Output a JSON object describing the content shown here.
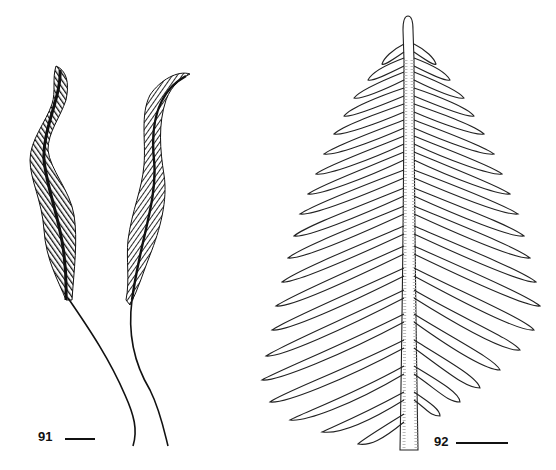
{
  "figure": {
    "panels": [
      {
        "id": "91",
        "label": "91",
        "description": "Two slender plumose colonies with long stalks",
        "scale_bar": "scale-bar"
      },
      {
        "id": "92",
        "label": "92",
        "description": "Broad feather-shaped frond with paired lateral branches along a central rachis",
        "scale_bar": "scale-bar"
      }
    ],
    "colors": {
      "ink": "#111111",
      "background": "#ffffff"
    }
  }
}
